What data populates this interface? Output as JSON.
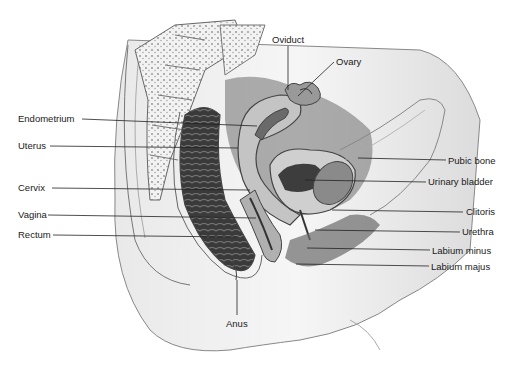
{
  "diagram": {
    "left_labels": [
      {
        "id": "endometrium",
        "text": "Endometrium",
        "x": 18,
        "y": 113
      },
      {
        "id": "uterus",
        "text": "Uterus",
        "x": 18,
        "y": 140
      },
      {
        "id": "cervix",
        "text": "Cervix",
        "x": 18,
        "y": 182
      },
      {
        "id": "vagina",
        "text": "Vagina",
        "x": 18,
        "y": 209
      },
      {
        "id": "rectum",
        "text": "Rectum",
        "x": 18,
        "y": 228
      }
    ],
    "top_labels": [
      {
        "id": "oviduct",
        "text": "Oviduct",
        "x": 272,
        "y": 35
      },
      {
        "id": "ovary",
        "text": "Ovary",
        "x": 336,
        "y": 57
      }
    ],
    "right_labels": [
      {
        "id": "pubic-bone",
        "text": "Pubic bone",
        "x": 448,
        "y": 155
      },
      {
        "id": "urinary-bladder",
        "text": "Urinary bladder",
        "x": 428,
        "y": 177
      },
      {
        "id": "clitoris",
        "text": "Clitoris",
        "x": 466,
        "y": 207
      },
      {
        "id": "urethra",
        "text": "Urethra",
        "x": 462,
        "y": 227
      },
      {
        "id": "labium-minus",
        "text": "Labium minus",
        "x": 432,
        "y": 245
      },
      {
        "id": "labium-majus",
        "text": "Labium majus",
        "x": 431,
        "y": 262
      }
    ],
    "bottom_labels": [
      {
        "id": "anus",
        "text": "Anus",
        "x": 226,
        "y": 318
      }
    ]
  }
}
